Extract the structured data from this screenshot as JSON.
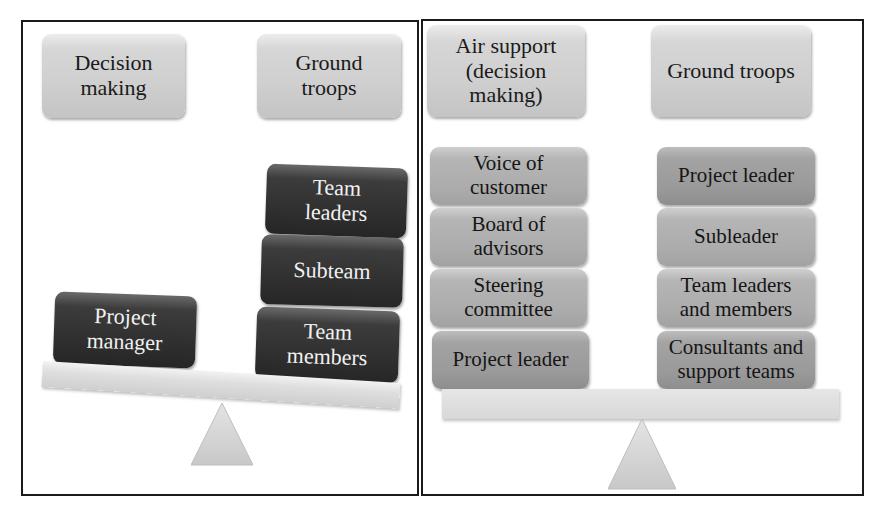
{
  "left_panel": {
    "header_boxes": [
      {
        "label": "Decision\nmaking"
      },
      {
        "label": "Ground\ntroops"
      }
    ],
    "left_pan": [
      {
        "label": "Project\nmanager"
      }
    ],
    "right_pan": [
      {
        "label": "Team\nleaders"
      },
      {
        "label": "Subteam"
      },
      {
        "label": "Team\nmembers"
      }
    ],
    "beam_state": "tilted-right-heavy"
  },
  "right_panel": {
    "header_boxes": [
      {
        "label": "Air support\n(decision\nmaking)"
      },
      {
        "label": "Ground troops"
      }
    ],
    "left_stack": [
      {
        "label": "Voice of\ncustomer"
      },
      {
        "label": "Board of\nadvisors"
      },
      {
        "label": "Steering\ncommittee"
      },
      {
        "label": "Project leader"
      }
    ],
    "right_stack": [
      {
        "label": "Project leader"
      },
      {
        "label": "Subleader"
      },
      {
        "label": "Team leaders\nand members"
      },
      {
        "label": "Consultants and\nsupport teams"
      }
    ],
    "beam_state": "balanced"
  },
  "colors": {
    "border": "#1a1a1a",
    "light_box": "#cfcfcf",
    "dark_box": "#2e2e2e",
    "mid_box": "#9a9a9a",
    "beam": "#dedede"
  }
}
